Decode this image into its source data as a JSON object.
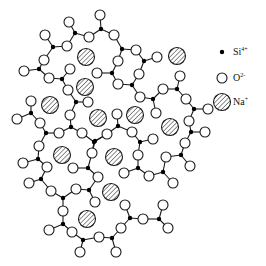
{
  "legend": {
    "items": [
      {
        "name": "si",
        "symbol": "Si",
        "charge": "4+",
        "marker": "filled-dot",
        "x": 233,
        "y": 52
      },
      {
        "name": "o",
        "symbol": "O",
        "charge": "2-",
        "marker": "open-circle",
        "x": 233,
        "y": 78
      },
      {
        "name": "na",
        "symbol": "Na",
        "charge": "+",
        "marker": "hatched-circle",
        "x": 233,
        "y": 102
      }
    ]
  },
  "colors": {
    "stroke": "#1a1a1a",
    "si_fill": "#000000",
    "o_fill": "#ffffff",
    "background": "#ffffff"
  },
  "network": {
    "si": [
      [
        75,
        33
      ],
      [
        101,
        29
      ],
      [
        122,
        49
      ],
      [
        53,
        47
      ],
      [
        39,
        69
      ],
      [
        62,
        79
      ],
      [
        76,
        102
      ],
      [
        112,
        73
      ],
      [
        132,
        85
      ],
      [
        144,
        61
      ],
      [
        153,
        99
      ],
      [
        177,
        89
      ],
      [
        194,
        109
      ],
      [
        191,
        132
      ],
      [
        181,
        155
      ],
      [
        163,
        172
      ],
      [
        159,
        219
      ],
      [
        130,
        218
      ],
      [
        112,
        238
      ],
      [
        140,
        142
      ],
      [
        118,
        126
      ],
      [
        94,
        142
      ],
      [
        71,
        127
      ],
      [
        46,
        133
      ],
      [
        31,
        113
      ],
      [
        38,
        159
      ],
      [
        41,
        179
      ],
      [
        63,
        198
      ],
      [
        63,
        224
      ],
      [
        83,
        240
      ],
      [
        89,
        190
      ],
      [
        88,
        168
      ],
      [
        95,
        141
      ],
      [
        138,
        168
      ]
    ],
    "o": [
      [
        69,
        22
      ],
      [
        89,
        37
      ],
      [
        100,
        15
      ],
      [
        114,
        35
      ],
      [
        136,
        50
      ],
      [
        45,
        35
      ],
      [
        67,
        46
      ],
      [
        44,
        60
      ],
      [
        24,
        71
      ],
      [
        49,
        78
      ],
      [
        70,
        69
      ],
      [
        68,
        90
      ],
      [
        88,
        102
      ],
      [
        70,
        115
      ],
      [
        97,
        73
      ],
      [
        118,
        61
      ],
      [
        118,
        84
      ],
      [
        139,
        74
      ],
      [
        157,
        57
      ],
      [
        140,
        97
      ],
      [
        163,
        89
      ],
      [
        180,
        76
      ],
      [
        186,
        99
      ],
      [
        208,
        109
      ],
      [
        156,
        113
      ],
      [
        189,
        121
      ],
      [
        205,
        132
      ],
      [
        185,
        143
      ],
      [
        166,
        157
      ],
      [
        190,
        166
      ],
      [
        173,
        183
      ],
      [
        149,
        176
      ],
      [
        163,
        205
      ],
      [
        168,
        228
      ],
      [
        143,
        219
      ],
      [
        125,
        205
      ],
      [
        121,
        228
      ],
      [
        116,
        252
      ],
      [
        99,
        237
      ],
      [
        80,
        252
      ],
      [
        72,
        232
      ],
      [
        49,
        230
      ],
      [
        63,
        211
      ],
      [
        51,
        191
      ],
      [
        76,
        189
      ],
      [
        29,
        183
      ],
      [
        47,
        167
      ],
      [
        23,
        163
      ],
      [
        39,
        146
      ],
      [
        31,
        101
      ],
      [
        17,
        119
      ],
      [
        40,
        123
      ],
      [
        59,
        133
      ],
      [
        82,
        133
      ],
      [
        92,
        153
      ],
      [
        98,
        177
      ],
      [
        95,
        202
      ],
      [
        124,
        173
      ],
      [
        138,
        155
      ],
      [
        153,
        139
      ],
      [
        132,
        132
      ],
      [
        117,
        114
      ],
      [
        107,
        134
      ]
    ],
    "na": [
      [
        86,
        57
      ],
      [
        85,
        87
      ],
      [
        50,
        105
      ],
      [
        98,
        118
      ],
      [
        135,
        115
      ],
      [
        177,
        56
      ],
      [
        170,
        127
      ],
      [
        62,
        155
      ],
      [
        114,
        157
      ],
      [
        111,
        192
      ],
      [
        87,
        219
      ]
    ],
    "bonds": [
      [
        [
          75,
          33
        ],
        [
          69,
          22
        ]
      ],
      [
        [
          75,
          33
        ],
        [
          89,
          37
        ]
      ],
      [
        [
          89,
          37
        ],
        [
          101,
          29
        ]
      ],
      [
        [
          101,
          29
        ],
        [
          100,
          15
        ]
      ],
      [
        [
          101,
          29
        ],
        [
          114,
          35
        ]
      ],
      [
        [
          114,
          35
        ],
        [
          122,
          49
        ]
      ],
      [
        [
          122,
          49
        ],
        [
          136,
          50
        ]
      ],
      [
        [
          122,
          49
        ],
        [
          118,
          61
        ]
      ],
      [
        [
          136,
          50
        ],
        [
          144,
          61
        ]
      ],
      [
        [
          144,
          61
        ],
        [
          157,
          57
        ]
      ],
      [
        [
          144,
          61
        ],
        [
          139,
          74
        ]
      ],
      [
        [
          139,
          74
        ],
        [
          132,
          85
        ]
      ],
      [
        [
          132,
          85
        ],
        [
          118,
          84
        ]
      ],
      [
        [
          132,
          85
        ],
        [
          140,
          97
        ]
      ],
      [
        [
          140,
          97
        ],
        [
          153,
          99
        ]
      ],
      [
        [
          118,
          84
        ],
        [
          112,
          73
        ]
      ],
      [
        [
          112,
          73
        ],
        [
          97,
          73
        ]
      ],
      [
        [
          112,
          73
        ],
        [
          118,
          61
        ]
      ],
      [
        [
          153,
          99
        ],
        [
          163,
          89
        ]
      ],
      [
        [
          153,
          99
        ],
        [
          156,
          113
        ]
      ],
      [
        [
          163,
          89
        ],
        [
          177,
          89
        ]
      ],
      [
        [
          177,
          89
        ],
        [
          180,
          76
        ]
      ],
      [
        [
          177,
          89
        ],
        [
          186,
          99
        ]
      ],
      [
        [
          186,
          99
        ],
        [
          194,
          109
        ]
      ],
      [
        [
          194,
          109
        ],
        [
          208,
          109
        ]
      ],
      [
        [
          194,
          109
        ],
        [
          189,
          121
        ]
      ],
      [
        [
          189,
          121
        ],
        [
          191,
          132
        ]
      ],
      [
        [
          191,
          132
        ],
        [
          205,
          132
        ]
      ],
      [
        [
          191,
          132
        ],
        [
          185,
          143
        ]
      ],
      [
        [
          185,
          143
        ],
        [
          181,
          155
        ]
      ],
      [
        [
          181,
          155
        ],
        [
          166,
          157
        ]
      ],
      [
        [
          181,
          155
        ],
        [
          190,
          166
        ]
      ],
      [
        [
          166,
          157
        ],
        [
          163,
          172
        ]
      ],
      [
        [
          163,
          172
        ],
        [
          173,
          183
        ]
      ],
      [
        [
          163,
          172
        ],
        [
          149,
          176
        ]
      ],
      [
        [
          149,
          176
        ],
        [
          138,
          168
        ]
      ],
      [
        [
          138,
          168
        ],
        [
          124,
          173
        ]
      ],
      [
        [
          138,
          168
        ],
        [
          138,
          155
        ]
      ],
      [
        [
          138,
          155
        ],
        [
          140,
          142
        ]
      ],
      [
        [
          140,
          142
        ],
        [
          153,
          139
        ]
      ],
      [
        [
          140,
          142
        ],
        [
          132,
          132
        ]
      ],
      [
        [
          132,
          132
        ],
        [
          118,
          126
        ]
      ],
      [
        [
          118,
          126
        ],
        [
          117,
          114
        ]
      ],
      [
        [
          118,
          126
        ],
        [
          107,
          134
        ]
      ],
      [
        [
          107,
          134
        ],
        [
          94,
          142
        ]
      ],
      [
        [
          94,
          142
        ],
        [
          82,
          133
        ]
      ],
      [
        [
          94,
          142
        ],
        [
          92,
          153
        ]
      ],
      [
        [
          82,
          133
        ],
        [
          71,
          127
        ]
      ],
      [
        [
          71,
          127
        ],
        [
          70,
          115
        ]
      ],
      [
        [
          71,
          127
        ],
        [
          59,
          133
        ]
      ],
      [
        [
          70,
          115
        ],
        [
          76,
          102
        ]
      ],
      [
        [
          76,
          102
        ],
        [
          68,
          90
        ]
      ],
      [
        [
          76,
          102
        ],
        [
          88,
          102
        ]
      ],
      [
        [
          68,
          90
        ],
        [
          62,
          79
        ]
      ],
      [
        [
          62,
          79
        ],
        [
          49,
          78
        ]
      ],
      [
        [
          62,
          79
        ],
        [
          70,
          69
        ]
      ],
      [
        [
          49,
          78
        ],
        [
          39,
          69
        ]
      ],
      [
        [
          39,
          69
        ],
        [
          24,
          71
        ]
      ],
      [
        [
          39,
          69
        ],
        [
          44,
          60
        ]
      ],
      [
        [
          44,
          60
        ],
        [
          53,
          47
        ]
      ],
      [
        [
          53,
          47
        ],
        [
          45,
          35
        ]
      ],
      [
        [
          53,
          47
        ],
        [
          67,
          46
        ]
      ],
      [
        [
          67,
          46
        ],
        [
          75,
          33
        ]
      ],
      [
        [
          59,
          133
        ],
        [
          46,
          133
        ]
      ],
      [
        [
          46,
          133
        ],
        [
          40,
          123
        ]
      ],
      [
        [
          46,
          133
        ],
        [
          39,
          146
        ]
      ],
      [
        [
          40,
          123
        ],
        [
          31,
          113
        ]
      ],
      [
        [
          31,
          113
        ],
        [
          31,
          101
        ]
      ],
      [
        [
          31,
          113
        ],
        [
          17,
          119
        ]
      ],
      [
        [
          39,
          146
        ],
        [
          38,
          159
        ]
      ],
      [
        [
          38,
          159
        ],
        [
          23,
          163
        ]
      ],
      [
        [
          38,
          159
        ],
        [
          47,
          167
        ]
      ],
      [
        [
          47,
          167
        ],
        [
          41,
          179
        ]
      ],
      [
        [
          41,
          179
        ],
        [
          29,
          183
        ]
      ],
      [
        [
          41,
          179
        ],
        [
          51,
          191
        ]
      ],
      [
        [
          51,
          191
        ],
        [
          63,
          198
        ]
      ],
      [
        [
          63,
          198
        ],
        [
          76,
          189
        ]
      ],
      [
        [
          63,
          198
        ],
        [
          63,
          211
        ]
      ],
      [
        [
          76,
          189
        ],
        [
          89,
          190
        ]
      ],
      [
        [
          89,
          190
        ],
        [
          95,
          202
        ]
      ],
      [
        [
          89,
          190
        ],
        [
          98,
          177
        ]
      ],
      [
        [
          98,
          177
        ],
        [
          88,
          168
        ]
      ],
      [
        [
          88,
          168
        ],
        [
          92,
          153
        ]
      ],
      [
        [
          88,
          168
        ],
        [
          73,
          168
        ]
      ],
      [
        [
          63,
          211
        ],
        [
          63,
          224
        ]
      ],
      [
        [
          63,
          224
        ],
        [
          49,
          230
        ]
      ],
      [
        [
          63,
          224
        ],
        [
          72,
          232
        ]
      ],
      [
        [
          72,
          232
        ],
        [
          83,
          240
        ]
      ],
      [
        [
          83,
          240
        ],
        [
          80,
          252
        ]
      ],
      [
        [
          83,
          240
        ],
        [
          99,
          237
        ]
      ],
      [
        [
          99,
          237
        ],
        [
          112,
          238
        ]
      ],
      [
        [
          112,
          238
        ],
        [
          116,
          252
        ]
      ],
      [
        [
          112,
          238
        ],
        [
          121,
          228
        ]
      ],
      [
        [
          121,
          228
        ],
        [
          130,
          218
        ]
      ],
      [
        [
          130,
          218
        ],
        [
          125,
          205
        ]
      ],
      [
        [
          130,
          218
        ],
        [
          143,
          219
        ]
      ],
      [
        [
          143,
          219
        ],
        [
          159,
          219
        ]
      ],
      [
        [
          159,
          219
        ],
        [
          163,
          205
        ]
      ],
      [
        [
          159,
          219
        ],
        [
          168,
          228
        ]
      ],
      [
        [
          95,
          141
        ],
        [
          92,
          153
        ]
      ],
      [
        [
          95,
          141
        ],
        [
          107,
          134
        ]
      ]
    ],
    "extra_o": [
      [
        73,
        168
      ]
    ]
  }
}
